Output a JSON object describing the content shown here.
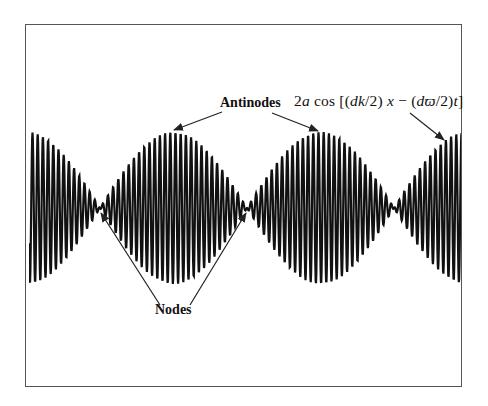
{
  "figure": {
    "labels": {
      "antinodes": "Antinodes",
      "nodes": "Nodes",
      "formula": "2a cos [(dk/2) x − (dϖ/2) t]"
    },
    "formula_parts": {
      "coef": "2",
      "a": "a",
      "cos": "cos",
      "open": "[(",
      "dk": "dk",
      "mid1": "/2)",
      "x": "x",
      "minus": " − (",
      "dw": "dϖ",
      "mid2": "/2)",
      "t": "t",
      "close": "]"
    },
    "colors": {
      "wave": "#111111",
      "frame": "#555555",
      "background": "#ffffff",
      "arrow": "#222222"
    }
  },
  "chart_data": {
    "type": "line",
    "title": "",
    "xlabel": "",
    "ylabel": "",
    "envelope_nodes_x_px": [
      100,
      247,
      392
    ],
    "envelope_antinodes_x_px": [
      30,
      173,
      318,
      462
    ],
    "center_y_px": 208,
    "amplitude_px": 76,
    "carrier_period_px": 5.2,
    "annotations": [
      {
        "text": "Antinodes",
        "points_to": [
          "antinode at x≈173",
          "antinode at x≈318"
        ]
      },
      {
        "text": "Nodes",
        "points_to": [
          "node at x≈100",
          "node at x≈247"
        ]
      },
      {
        "text": "2a cos [(dk/2) x − (dϖ/2) t]",
        "points_to": [
          "envelope near x≈445"
        ]
      }
    ],
    "grid": false,
    "legend": null
  }
}
